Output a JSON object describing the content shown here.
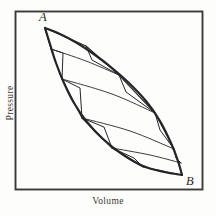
{
  "figure": {
    "kind": "pressure-volume-diagram",
    "background_color": "#fdfdfb",
    "ink_color": "#26262a",
    "frame": {
      "name": "plot-frame",
      "x": 14.5,
      "y": 10.5,
      "width": 188,
      "height": 179,
      "stroke": "#3a3a38",
      "stroke_width": 1.9
    },
    "axes": {
      "x_label": "Volume",
      "y_label": "Pressure"
    },
    "points": [
      {
        "id": "A",
        "label": "A",
        "x": 45,
        "y": 28,
        "label_x": 39,
        "label_y": 10
      },
      {
        "id": "B",
        "label": "B",
        "x": 182,
        "y": 175,
        "label_x": 186,
        "label_y": 174
      }
    ]
  },
  "chart_data": {
    "type": "line",
    "title": "",
    "xlabel": "Volume",
    "ylabel": "Pressure",
    "grid": false,
    "legend": null,
    "annotations": [
      {
        "text": "A",
        "x": 45,
        "y": 28
      },
      {
        "text": "B",
        "x": 182,
        "y": 175
      }
    ],
    "series": [
      {
        "name": "upper-reversible-path",
        "role": "outer-cycle-upper-branch",
        "stroke_width": 2.2,
        "points": [
          [
            45,
            28
          ],
          [
            60,
            34
          ],
          [
            77,
            43
          ],
          [
            95,
            55
          ],
          [
            112,
            68
          ],
          [
            129,
            83
          ],
          [
            146,
            101
          ],
          [
            160,
            121
          ],
          [
            171,
            143
          ],
          [
            178,
            161
          ],
          [
            182,
            175
          ]
        ]
      },
      {
        "name": "lower-reversible-path",
        "role": "outer-cycle-lower-branch",
        "stroke_width": 2.2,
        "points": [
          [
            45,
            28
          ],
          [
            50,
            44
          ],
          [
            56,
            63
          ],
          [
            64,
            83
          ],
          [
            74,
            103
          ],
          [
            87,
            122
          ],
          [
            103,
            139
          ],
          [
            122,
            154
          ],
          [
            143,
            166
          ],
          [
            164,
            172
          ],
          [
            182,
            175
          ]
        ]
      },
      {
        "name": "isotherm-1",
        "role": "isotherm",
        "stroke_width": 0.9,
        "points": [
          [
            51,
            49
          ],
          [
            86,
            61
          ],
          [
            119,
            75
          ]
        ]
      },
      {
        "name": "isotherm-2",
        "role": "isotherm",
        "stroke_width": 0.9,
        "points": [
          [
            62,
            79
          ],
          [
            112,
            94
          ],
          [
            155,
            113
          ]
        ]
      },
      {
        "name": "isotherm-3",
        "role": "isotherm",
        "stroke_width": 0.9,
        "points": [
          [
            82,
            118
          ],
          [
            130,
            131
          ],
          [
            174,
            149
          ]
        ]
      },
      {
        "name": "isotherm-4",
        "role": "isotherm",
        "stroke_width": 0.9,
        "points": [
          [
            112,
            148
          ],
          [
            150,
            155
          ],
          [
            181,
            163
          ]
        ]
      },
      {
        "name": "carnot-staircase",
        "role": "adiabat-isotherm-zigzag",
        "stroke_width": 1.1,
        "points": [
          [
            45,
            28
          ],
          [
            51,
            49
          ],
          [
            62,
            79
          ],
          [
            82,
            118
          ],
          [
            112,
            148
          ],
          [
            143,
            167
          ],
          [
            182,
            175
          ],
          [
            174,
            149
          ],
          [
            155,
            113
          ],
          [
            119,
            75
          ],
          [
            86,
            46
          ],
          [
            45,
            28
          ]
        ]
      },
      {
        "name": "step-notch-1",
        "role": "adiabat-step",
        "stroke_width": 1.0,
        "points": [
          [
            86,
            46
          ],
          [
            92,
            60
          ],
          [
            119,
            75
          ]
        ]
      },
      {
        "name": "step-notch-2",
        "role": "adiabat-step",
        "stroke_width": 1.0,
        "points": [
          [
            119,
            75
          ],
          [
            126,
            92
          ],
          [
            155,
            113
          ]
        ]
      },
      {
        "name": "step-notch-3",
        "role": "adiabat-step",
        "stroke_width": 1.0,
        "points": [
          [
            155,
            113
          ],
          [
            160,
            130
          ],
          [
            174,
            149
          ]
        ]
      },
      {
        "name": "step-notch-4",
        "role": "adiabat-step",
        "stroke_width": 1.0,
        "points": [
          [
            174,
            149
          ],
          [
            176,
            158
          ],
          [
            181,
            163
          ]
        ]
      },
      {
        "name": "step-notch-5",
        "role": "adiabat-step",
        "stroke_width": 1.0,
        "points": [
          [
            51,
            49
          ],
          [
            63,
            53
          ],
          [
            62,
            79
          ]
        ]
      },
      {
        "name": "step-notch-6",
        "role": "adiabat-step",
        "stroke_width": 1.0,
        "points": [
          [
            62,
            79
          ],
          [
            80,
            88
          ],
          [
            82,
            118
          ]
        ]
      },
      {
        "name": "step-notch-7",
        "role": "adiabat-step",
        "stroke_width": 1.0,
        "points": [
          [
            82,
            118
          ],
          [
            104,
            127
          ],
          [
            112,
            148
          ]
        ]
      },
      {
        "name": "step-notch-8",
        "role": "adiabat-step",
        "stroke_width": 1.0,
        "points": [
          [
            112,
            148
          ],
          [
            134,
            158
          ],
          [
            143,
            167
          ]
        ]
      }
    ]
  }
}
